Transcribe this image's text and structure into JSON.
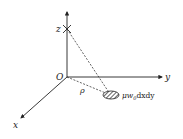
{
  "diagram": {
    "type": "3d-coordinate-system",
    "axes": {
      "x_label": "x",
      "y_label": "y",
      "z_label": "z",
      "origin_label": "O"
    },
    "distance_label": "ρ",
    "element_label_main": "μw",
    "element_label_sub": "0",
    "element_label_tail": "dxdy",
    "colors": {
      "stroke": "#222222",
      "background": "#ffffff"
    }
  }
}
